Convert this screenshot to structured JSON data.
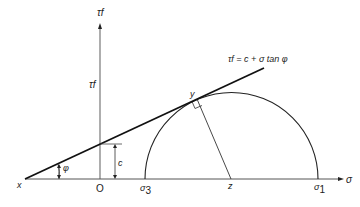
{
  "diagram": {
    "type": "mohr-coulomb-failure-envelope",
    "axes": {
      "vertical_label_top": "τf",
      "vertical_label_side": "τf",
      "horizontal_label": "σ"
    },
    "points": {
      "x": "x",
      "origin": "O",
      "sigma3": "σ",
      "sigma3_sub": "3",
      "sigma1": "σ",
      "sigma1_sub": "1",
      "z": "z",
      "y": "y"
    },
    "labels": {
      "cohesion": "c",
      "angle": "φ",
      "envelope_equation": "τf = c + σ tan φ"
    },
    "colors": {
      "line": "#1a1a1a",
      "axis": "#555555",
      "background": "#ffffff"
    }
  }
}
